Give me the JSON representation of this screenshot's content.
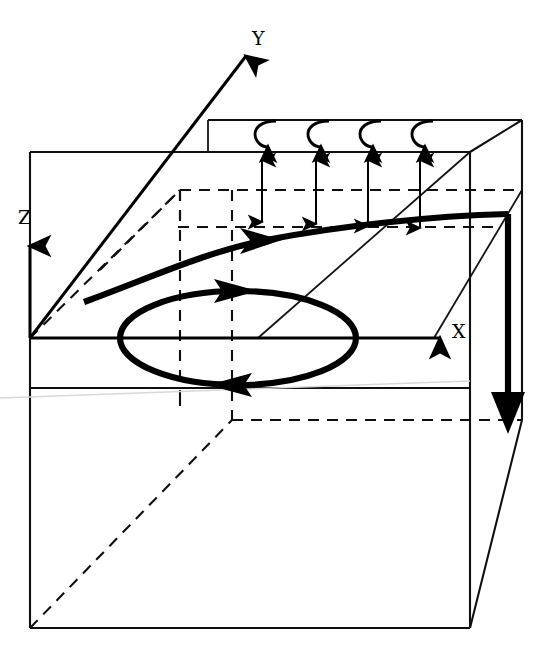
{
  "figure": {
    "kind": "3d-flow-schematic",
    "background_color": "#ffffff",
    "line_color": "#101010",
    "accent_color": "#000000",
    "width": 552,
    "height": 663
  },
  "axes": {
    "x": {
      "label": "X",
      "label_x": 458,
      "label_y": 336,
      "from": [
        30,
        338
      ],
      "to": [
        448,
        338
      ]
    },
    "y": {
      "label": "Y",
      "label_x": 258,
      "label_y": 44,
      "from": [
        30,
        338
      ],
      "to": [
        249,
        53
      ]
    },
    "z": {
      "label": "Z",
      "label_x": 24,
      "label_y": 222,
      "from": [
        30,
        338
      ],
      "to": [
        30,
        238
      ]
    },
    "origin": [
      30,
      338
    ]
  },
  "box": {
    "front": {
      "left": 30,
      "right": 470,
      "top": 152,
      "bottom": 628
    },
    "depth_dx": 52,
    "depth_dy": -32,
    "note_visible_edges": "solid front/right, dashed hidden rear"
  },
  "annotations": {
    "curl_arrows": {
      "count": 4,
      "x_positions": [
        266,
        319,
        371,
        423
      ],
      "top_y": 120,
      "bottom_y": 152,
      "name": "spanwise-vorticity-curl"
    },
    "double_arrows": {
      "count": 4,
      "x_positions": [
        262,
        316,
        368,
        420
      ],
      "top_y": 153,
      "bottom_y": 227,
      "name": "shear-layer-thickness-arrows"
    },
    "vortex_ring": {
      "cx": 238,
      "cy": 338,
      "rx": 118,
      "ry": 47,
      "arrow_top_x": 250,
      "arrow_bottom_x": 228,
      "name": "recirculation-vortex-loop"
    },
    "streamline": {
      "name": "separating-shear-layer-streamline",
      "start": [
        86,
        300
      ],
      "arrow1": [
        266,
        240
      ],
      "corner": [
        508,
        214
      ],
      "end": [
        512,
        430
      ]
    }
  },
  "labels": {
    "x_axis": "X",
    "y_axis": "Y",
    "z_axis": "Z"
  }
}
